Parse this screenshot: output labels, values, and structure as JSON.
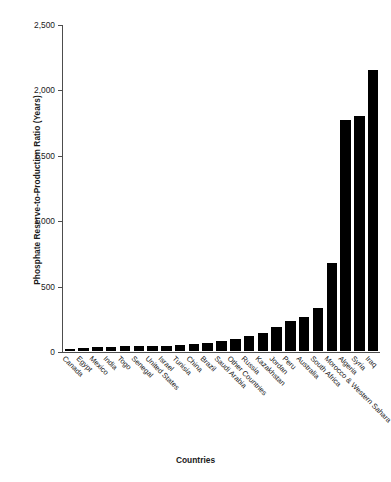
{
  "chart_data": {
    "type": "bar",
    "title": "",
    "xlabel": "Countries",
    "ylabel": "Phosphate Reserve-to-Production Ratio (Years)",
    "ylim": [
      0,
      2500
    ],
    "yticks": [
      0,
      500,
      1000,
      1500,
      2000,
      2500
    ],
    "ytick_labels": [
      "0",
      "500",
      "1,000",
      "1,500",
      "2,000",
      "2,500"
    ],
    "grid": false,
    "legend": false,
    "bar_color": "#000000",
    "axis_color": "#4d4d4d",
    "categories": [
      "Canada",
      "Egypt",
      "Mexico",
      "India",
      "Togo",
      "Senegal",
      "United States",
      "Israel",
      "Tunisia",
      "China",
      "Brazil",
      "Saudi Arabia",
      "Other Countries",
      "Russia",
      "Kazakhstan",
      "Jordan",
      "Peru",
      "Australia",
      "South Africa",
      "Morocco & Western Sahara",
      "Algeria",
      "Syria",
      "Iraq"
    ],
    "values": [
      15,
      25,
      28,
      32,
      35,
      38,
      40,
      42,
      45,
      50,
      58,
      75,
      95,
      115,
      140,
      185,
      230,
      260,
      330,
      670,
      1765,
      1800,
      2150
    ]
  }
}
